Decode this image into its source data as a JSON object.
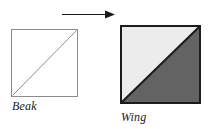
{
  "figure": {
    "type": "transformation-diagram",
    "source": {
      "label": "Beak",
      "shape": "square",
      "fill": "#ffffff",
      "border_color": "#8c8c8c",
      "border_width_px": 1,
      "diagonal": {
        "present": true,
        "direction": "bottom-left-to-top-right",
        "stroke": "#8c8c8c",
        "stroke_width_px": 1
      }
    },
    "target": {
      "label": "Wing",
      "shape": "square",
      "border_color": "#1c1c1c",
      "border_width_px": 2,
      "diagonal": {
        "present": true,
        "direction": "bottom-left-to-top-right",
        "stroke": "#1c1c1c",
        "stroke_width_px": 2
      },
      "regions": [
        {
          "name": "upper-left-triangle",
          "fill": "#ececec"
        },
        {
          "name": "lower-right-triangle",
          "fill": "#636363"
        }
      ]
    },
    "arrow": {
      "direction": "right",
      "color": "#1a1a1a",
      "shaft_thickness_px": 1
    },
    "background": "#ffffff"
  }
}
